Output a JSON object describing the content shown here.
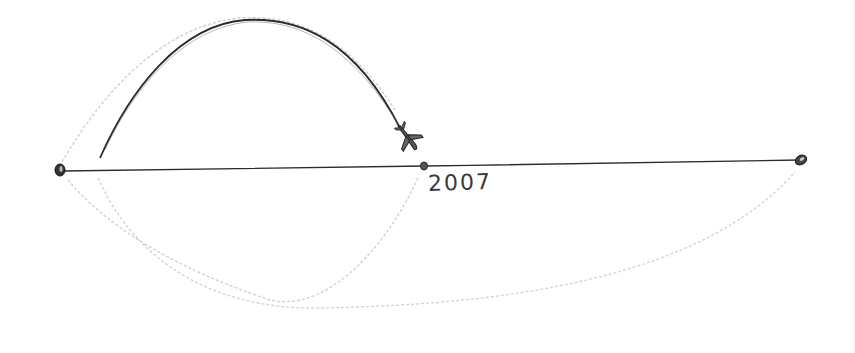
{
  "diagram": {
    "timeline": {
      "start_point": {
        "x": 60,
        "y": 170
      },
      "mid_point": {
        "x": 425,
        "y": 166,
        "label": "2007"
      },
      "end_point": {
        "x": 800,
        "y": 160
      }
    },
    "arcs": [
      {
        "name": "dark-arc-upper",
        "description": "dark solid arc from left toward midpoint ending in airplane"
      },
      {
        "name": "faint-arc-upper",
        "description": "faint pencil arc above timeline"
      },
      {
        "name": "faint-arc-lower-left",
        "description": "faint pencil arc below timeline from left"
      },
      {
        "name": "faint-arc-lower-long",
        "description": "faint pencil arc below timeline to right end"
      }
    ],
    "icon": "airplane-icon",
    "colors": {
      "ink": "#2b2b2b",
      "pencil": "#c8c8c8",
      "background": "#ffffff"
    }
  }
}
